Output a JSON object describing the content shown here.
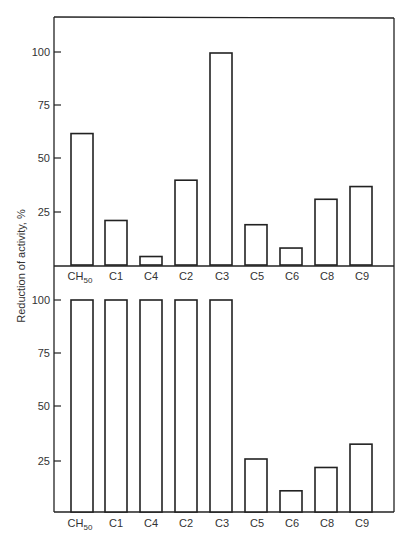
{
  "chart_data": [
    {
      "type": "bar",
      "panel": "top",
      "title": "",
      "xlabel": "",
      "ylabel": "Reduction of activity, %",
      "ylim": [
        0,
        115
      ],
      "yticks": [
        25,
        50,
        75,
        100
      ],
      "grid": false,
      "legend": null,
      "categories": [
        "CH50",
        "C1",
        "C4",
        "C2",
        "C3",
        "C5",
        "C6",
        "C8",
        "C9"
      ],
      "values": [
        62,
        21,
        4,
        40,
        100,
        19,
        8,
        31,
        37
      ]
    },
    {
      "type": "bar",
      "panel": "bottom",
      "title": "",
      "xlabel": "",
      "ylabel": "Reduction of activity, %",
      "ylim": [
        0,
        100
      ],
      "yticks": [
        25,
        50,
        75,
        100
      ],
      "grid": false,
      "legend": null,
      "categories": [
        "CH50",
        "C1",
        "C4",
        "C2",
        "C3",
        "C5",
        "C6",
        "C8",
        "C9"
      ],
      "values": [
        100,
        100,
        100,
        100,
        100,
        25,
        10,
        21,
        32
      ]
    }
  ],
  "labels": {
    "ylabel": "Reduction of activity, %",
    "ytick_25": "25",
    "ytick_50": "50",
    "ytick_75": "75",
    "ytick_100": "100",
    "cat_ch": "CH",
    "cat_ch_sub": "50",
    "cat_c1": "C1",
    "cat_c4": "C4",
    "cat_c2": "C2",
    "cat_c3": "C3",
    "cat_c5": "C5",
    "cat_c6": "C6",
    "cat_c8": "C8",
    "cat_c9": "C9"
  }
}
